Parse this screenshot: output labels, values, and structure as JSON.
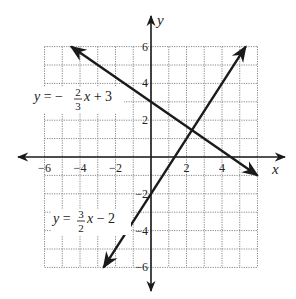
{
  "chart_data": {
    "type": "line",
    "title": "",
    "xlabel": "x",
    "ylabel": "y",
    "xlim": [
      -6,
      6
    ],
    "ylim": [
      -6,
      6
    ],
    "grid": true,
    "grid_style": "dotted",
    "x_ticks": [
      -6,
      -4,
      -2,
      2,
      4
    ],
    "y_ticks": [
      6,
      4,
      2,
      -2,
      -4,
      -6
    ],
    "x_tick_labels": [
      "−6",
      "−4",
      "−2",
      "2",
      "4"
    ],
    "y_tick_labels": [
      "6",
      "4",
      "2",
      "−2",
      "−4",
      "−6"
    ],
    "series": [
      {
        "name": "y = -2/3 x + 3",
        "label_parts": {
          "prefix": "y = −",
          "num": "2",
          "den": "3",
          "suffix": "x + 3"
        },
        "slope": -0.6667,
        "intercept": 3,
        "x": [
          -4.5,
          6
        ],
        "y": [
          6,
          -1
        ],
        "arrows": "both"
      },
      {
        "name": "y = 3/2 x - 2",
        "label_parts": {
          "prefix": "y = ",
          "num": "3",
          "den": "2",
          "suffix": "x − 2"
        },
        "slope": 1.5,
        "intercept": -2,
        "x": [
          -2.667,
          5.333
        ],
        "y": [
          -6,
          6
        ],
        "arrows": "both"
      }
    ],
    "annotations": [
      {
        "text": "intersection",
        "x": 2.31,
        "y": 1.46
      }
    ],
    "line_color": "#1a1a1a",
    "grid_color": "#888888"
  }
}
